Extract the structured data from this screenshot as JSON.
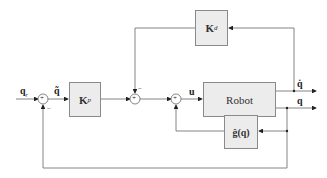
{
  "diagram": {
    "type": "block-diagram",
    "blocks": {
      "kp": {
        "label": "K",
        "sub": "p"
      },
      "kd": {
        "label": "K",
        "sub": "d"
      },
      "robot": {
        "label": "Robot"
      },
      "gravity": {
        "label": "ĝ(q)"
      }
    },
    "signals": {
      "reference": {
        "label": "q",
        "sub": "r"
      },
      "error": {
        "label": "q̃"
      },
      "input": {
        "label": "u"
      },
      "velocity_out": {
        "label": "q̇"
      },
      "position_out": {
        "label": "q"
      }
    },
    "junctions": {
      "sum1": {
        "label": "+",
        "feedback_sign": "−"
      },
      "sum2": {
        "label": "+",
        "feedback_sign": "−"
      },
      "sum3": {
        "label": "+"
      }
    },
    "colors": {
      "line": "#555555",
      "block_fill": "#ececec",
      "block_border": "#8a8a8a"
    }
  }
}
